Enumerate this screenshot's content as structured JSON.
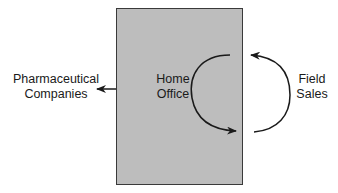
{
  "diagram": {
    "type": "flow-diagram",
    "box": {
      "label_lines": [
        "Home",
        "Office"
      ],
      "fill": "#bdbdbd",
      "border": "#3a3a3a"
    },
    "external_left": {
      "label_lines": [
        "Pharmaceutical",
        "Companies"
      ]
    },
    "external_right": {
      "label_lines": [
        "Field",
        "Sales"
      ]
    },
    "arrows": [
      {
        "from": "Home Office",
        "to": "Pharmaceutical Companies",
        "style": "straight"
      },
      {
        "from": "Home Office",
        "to": "Field Sales",
        "style": "curved"
      },
      {
        "from": "Field Sales",
        "to": "Home Office",
        "style": "curved"
      }
    ],
    "colors": {
      "stroke": "#1a1a1a",
      "background": "#ffffff"
    }
  }
}
